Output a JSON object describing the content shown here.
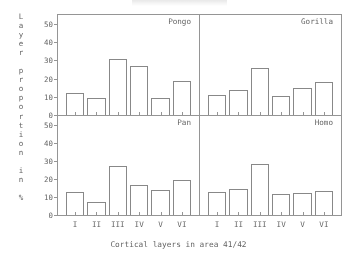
{
  "axes": {
    "ylabel_text": "Layer proportion in %",
    "ylabel_chars": [
      "L",
      "a",
      "y",
      "e",
      "r",
      "",
      "p",
      "r",
      "o",
      "p",
      "o",
      "r",
      "t",
      "i",
      "o",
      "n",
      "",
      "i",
      "n",
      "",
      "%"
    ],
    "xlabel": "Cortical layers in area 41/42",
    "yticks": [
      0,
      10,
      20,
      30,
      40,
      50
    ],
    "ylim": [
      0,
      55
    ],
    "categories": [
      "I",
      "II",
      "III",
      "IV",
      "V",
      "VI"
    ]
  },
  "panels": [
    {
      "title": "Pongo",
      "values": [
        12,
        9.5,
        31,
        27,
        9.5,
        18.5
      ]
    },
    {
      "title": "Gorilla",
      "values": [
        11,
        13.5,
        26,
        10.5,
        15,
        18
      ]
    },
    {
      "title": "Pan",
      "values": [
        13,
        7,
        27.5,
        16.5,
        14,
        19.5
      ]
    },
    {
      "title": "Homo",
      "values": [
        13,
        14.5,
        28.5,
        11.5,
        12,
        13.5
      ]
    }
  ],
  "chart_data": {
    "type": "bar",
    "title": "",
    "xlabel": "Cortical layers in area 41/42",
    "ylabel": "Layer proportion in %",
    "categories": [
      "I",
      "II",
      "III",
      "IV",
      "V",
      "VI"
    ],
    "ylim": [
      0,
      55
    ],
    "yticks": [
      0,
      10,
      20,
      30,
      40,
      50
    ],
    "grid": false,
    "legend": "none",
    "layout": "2x2 small-multiples",
    "series": [
      {
        "name": "Pongo",
        "panel": "top-left",
        "values": [
          12,
          9.5,
          31,
          27,
          9.5,
          18.5
        ]
      },
      {
        "name": "Gorilla",
        "panel": "top-right",
        "values": [
          11,
          13.5,
          26,
          10.5,
          15,
          18
        ]
      },
      {
        "name": "Pan",
        "panel": "bottom-left",
        "values": [
          13,
          7,
          27.5,
          16.5,
          14,
          19.5
        ]
      },
      {
        "name": "Homo",
        "panel": "bottom-right",
        "values": [
          13,
          14.5,
          28.5,
          11.5,
          12,
          13.5
        ]
      }
    ]
  }
}
